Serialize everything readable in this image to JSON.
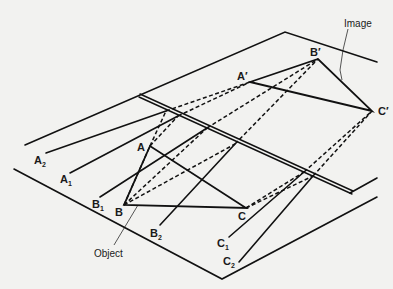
{
  "diagram": {
    "labels": {
      "image": "Image",
      "object": "Object",
      "A": "A",
      "B": "B",
      "C": "C",
      "A_prime": "A′",
      "B_prime": "B′",
      "C_prime": "C′",
      "A1": "A",
      "A1_sub": "1",
      "A2": "A",
      "A2_sub": "2",
      "B1": "B",
      "B1_sub": "1",
      "B2": "B",
      "B2_sub": "2",
      "C1": "C",
      "C1_sub": "1",
      "C2": "C",
      "C2_sub": "2"
    },
    "colors": {
      "background": "#f2f2f0",
      "ink": "#111111"
    }
  }
}
